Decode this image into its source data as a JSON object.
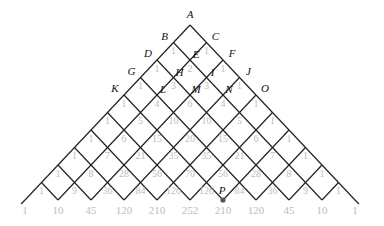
{
  "diagram": {
    "apex": {
      "x": 190,
      "y": 25
    },
    "step": {
      "dx": 16.5,
      "dy": 17.5
    },
    "rows": 10,
    "line_color": "#222222",
    "number_color": "#bdbdbd",
    "point_labels": [
      {
        "name": "A",
        "r": 0,
        "k": 0
      },
      {
        "name": "B",
        "r": 1,
        "k": 0
      },
      {
        "name": "C",
        "r": 1,
        "k": 1
      },
      {
        "name": "D",
        "r": 2,
        "k": 0
      },
      {
        "name": "E",
        "r": 2,
        "k": 1
      },
      {
        "name": "F",
        "r": 2,
        "k": 2
      },
      {
        "name": "G",
        "r": 3,
        "k": 0
      },
      {
        "name": "H",
        "r": 3,
        "k": 1
      },
      {
        "name": "I",
        "r": 3,
        "k": 2
      },
      {
        "name": "J",
        "r": 3,
        "k": 3
      },
      {
        "name": "K",
        "r": 4,
        "k": 0
      },
      {
        "name": "L",
        "r": 4,
        "k": 1
      },
      {
        "name": "M",
        "r": 4,
        "k": 2
      },
      {
        "name": "N",
        "r": 4,
        "k": 3
      },
      {
        "name": "O",
        "r": 4,
        "k": 4
      },
      {
        "name": "P",
        "r": 10,
        "k": 6
      }
    ],
    "bottom_values": [
      "1",
      "10",
      "45",
      "120",
      "210",
      "252",
      "210",
      "120",
      "45",
      "10",
      "1"
    ]
  }
}
